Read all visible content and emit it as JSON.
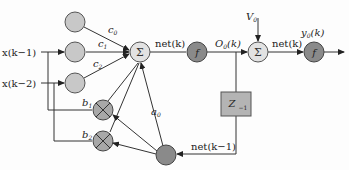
{
  "diagram": {
    "inputs": {
      "x1": "x(k−1)",
      "x2": "x(k−2)"
    },
    "weights": {
      "c0": "c",
      "c0_sub": "0",
      "c1": "c",
      "c1_sub": "1",
      "c2": "c",
      "c2_sub": "2",
      "b1": "b",
      "b1_sub": "1",
      "b2": "b",
      "b2_sub": "2",
      "a0": "a",
      "a0_sub": "0"
    },
    "nodes": {
      "sum1": "Σ",
      "f1": "f",
      "sum2": "Σ",
      "f2": "f",
      "delay": "Z",
      "delay_sub": "−1"
    },
    "signals": {
      "net_k": "net(k)",
      "o0_k": "O",
      "o0_sub": "0",
      "o0_arg": "(k)",
      "v0": "V",
      "v0_sub": "0",
      "net_k2": "net(k)",
      "y0_k": "y",
      "y0_sub": "0",
      "y0_arg": "(k)",
      "net_km1": "net(k−1)"
    },
    "colors": {
      "light_node": "#c8c8c8",
      "dark_node": "#8a8a8a",
      "sum_node": "#e2e2e2",
      "delay_box": "#b4b4b4",
      "line": "#333333"
    }
  }
}
